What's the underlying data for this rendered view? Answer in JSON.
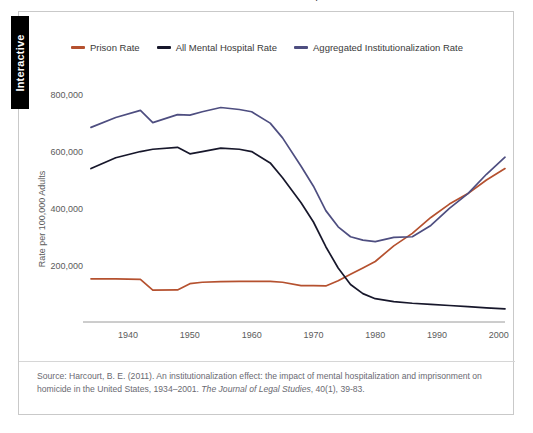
{
  "page": {
    "title_sliver": "Rates of Institutionalization, 1934–2001",
    "background_color": "#ffffff"
  },
  "interactive_tab": {
    "label": "Interactive"
  },
  "legend": {
    "position": "top-center",
    "items": [
      {
        "label": "Prison Rate",
        "color": "#b5512f",
        "key": "prison"
      },
      {
        "label": "All Mental Hospital Rate",
        "color": "#17172b",
        "key": "mental_hospital"
      },
      {
        "label": "Aggregated Institutionalization Rate",
        "color": "#4e4e80",
        "key": "aggregated"
      }
    ]
  },
  "source": {
    "prefix": "Source: Harcourt, B. E. (2011). An institutionalization effect: the impact of mental hospitalization and imprisonment on homicide in the United States, 1934–2001. ",
    "journal": "The Journal of Legal Studies",
    "suffix": ", 40(1), 39-83."
  },
  "chart_data": {
    "type": "line",
    "title": "Rates of Institutionalization, 1934–2001",
    "xlabel": "",
    "ylabel": "Rate per 100,000 Adults",
    "xlim": [
      1934,
      2001
    ],
    "ylim": [
      0,
      880000
    ],
    "grid": false,
    "legend_position": "top-center",
    "xticks": [
      1940,
      1950,
      1960,
      1970,
      1980,
      1990,
      2000
    ],
    "yticks": [
      200000,
      400000,
      600000,
      800000
    ],
    "ytick_labels": [
      "200,000",
      "400,000",
      "600,000",
      "800,000"
    ],
    "x": [
      1934,
      1938,
      1942,
      1944,
      1948,
      1950,
      1952,
      1955,
      1958,
      1960,
      1963,
      1965,
      1968,
      1970,
      1972,
      1974,
      1976,
      1978,
      1980,
      1983,
      1986,
      1989,
      1992,
      1995,
      1998,
      2001
    ],
    "series": [
      {
        "name": "Prison Rate",
        "color": "#b5512f",
        "values": [
          152000,
          152000,
          150000,
          112000,
          113000,
          135000,
          140000,
          142000,
          143000,
          143000,
          143000,
          140000,
          128000,
          128000,
          127000,
          145000,
          168000,
          190000,
          213000,
          268000,
          312000,
          368000,
          415000,
          452000,
          500000,
          540000
        ]
      },
      {
        "name": "All Mental Hospital Rate",
        "color": "#17172b",
        "values": [
          540000,
          578000,
          600000,
          608000,
          615000,
          592000,
          600000,
          612000,
          608000,
          600000,
          560000,
          508000,
          420000,
          352000,
          265000,
          190000,
          132000,
          100000,
          82000,
          72000,
          66000,
          62000,
          58000,
          54000,
          50000,
          46000
        ]
      },
      {
        "name": "Aggregated Institutionalization Rate",
        "color": "#4e4e80",
        "values": [
          685000,
          720000,
          745000,
          702000,
          730000,
          728000,
          740000,
          755000,
          748000,
          740000,
          700000,
          648000,
          548000,
          478000,
          392000,
          335000,
          300000,
          288000,
          283000,
          298000,
          300000,
          340000,
          400000,
          452000,
          520000,
          580000
        ]
      }
    ]
  }
}
